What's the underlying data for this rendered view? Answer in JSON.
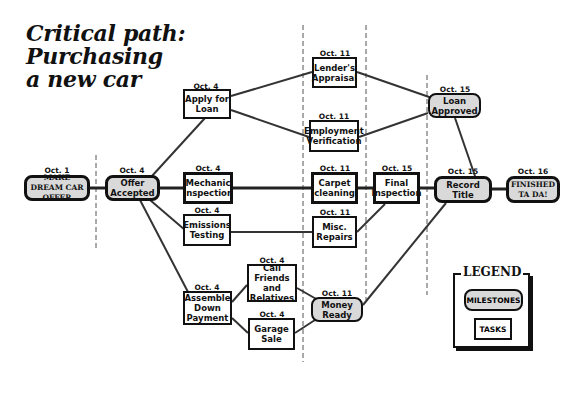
{
  "title": {
    "line1": "Critical path:",
    "line2": "Purchasing",
    "line3": "a new car"
  },
  "colors": {
    "milestone_fill": "#d9d9d9",
    "task_fill": "#ffffff",
    "stroke": "#111111",
    "edge": "#333333"
  },
  "nodes": {
    "make_dream": {
      "date": "Oct. 1",
      "label": "MAKE DREAM CAR OFFER",
      "type": "milestone"
    },
    "offer_accepted": {
      "date": "Oct. 4",
      "label": "Offer Accepted",
      "type": "milestone"
    },
    "apply_loan": {
      "date": "Oct. 4",
      "label": "Apply for Loan",
      "type": "task"
    },
    "mechanic": {
      "date": "Oct. 4",
      "label": "Mechanic Inspection",
      "type": "task",
      "critical": true
    },
    "emissions": {
      "date": "Oct. 4",
      "label": "Emissions Testing",
      "type": "task"
    },
    "assemble": {
      "date": "Oct. 4",
      "label": "Assemble Down Payment",
      "type": "task"
    },
    "call_friends": {
      "date": "Oct. 4",
      "label": "Call Friends and Relatives",
      "type": "task"
    },
    "garage_sale": {
      "date": "Oct. 4",
      "label": "Garage Sale",
      "type": "task"
    },
    "lenders": {
      "date": "Oct. 11",
      "label": "Lender's Appraisal",
      "type": "task"
    },
    "employment": {
      "date": "Oct. 11",
      "label": "Employment Verification",
      "type": "task"
    },
    "carpet": {
      "date": "Oct. 11",
      "label": "Carpet cleaning",
      "type": "task",
      "critical": true
    },
    "misc": {
      "date": "Oct. 11",
      "label": "Misc. Repairs",
      "type": "task"
    },
    "money_ready": {
      "date": "Oct. 11",
      "label": "Money Ready",
      "type": "milestone"
    },
    "final": {
      "date": "Oct. 15",
      "label": "Final Inspection",
      "type": "task",
      "critical": true
    },
    "loan_approved": {
      "date": "Oct. 15",
      "label": "Loan Approved",
      "type": "milestone"
    },
    "record_title": {
      "date": "Oct. 15",
      "label": "Record Title",
      "type": "milestone"
    },
    "finished": {
      "date": "Oct. 16",
      "label": "FINISHED TA DA!",
      "type": "milestone"
    }
  },
  "edges": [
    [
      "make_dream",
      "offer_accepted"
    ],
    [
      "offer_accepted",
      "apply_loan"
    ],
    [
      "offer_accepted",
      "mechanic"
    ],
    [
      "offer_accepted",
      "emissions"
    ],
    [
      "offer_accepted",
      "assemble"
    ],
    [
      "apply_loan",
      "lenders"
    ],
    [
      "apply_loan",
      "employment"
    ],
    [
      "lenders",
      "loan_approved"
    ],
    [
      "employment",
      "loan_approved"
    ],
    [
      "loan_approved",
      "record_title"
    ],
    [
      "mechanic",
      "carpet"
    ],
    [
      "carpet",
      "final"
    ],
    [
      "final",
      "record_title"
    ],
    [
      "emissions",
      "misc"
    ],
    [
      "misc",
      "final"
    ],
    [
      "assemble",
      "call_friends"
    ],
    [
      "assemble",
      "garage_sale"
    ],
    [
      "call_friends",
      "money_ready"
    ],
    [
      "garage_sale",
      "money_ready"
    ],
    [
      "money_ready",
      "record_title"
    ],
    [
      "record_title",
      "finished"
    ]
  ],
  "legend": {
    "title": "LEGEND",
    "milestones": "MILESTONES",
    "tasks": "TASKS"
  }
}
